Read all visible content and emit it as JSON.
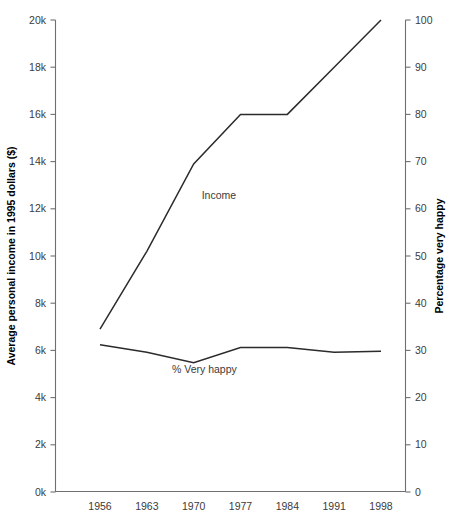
{
  "chart_data": {
    "type": "line",
    "title": "",
    "xlabel": "",
    "ylabel": "Average personal income in 1995 dollars ($)",
    "y2label": "Percentage very happy",
    "categories": [
      "1956",
      "1963",
      "1970",
      "1977",
      "1984",
      "1991",
      "1998"
    ],
    "x": [
      1956,
      1963,
      1970,
      1977,
      1984,
      1991,
      1998
    ],
    "ylim": [
      0,
      20000
    ],
    "y2lim": [
      0,
      100
    ],
    "grid": false,
    "legend_position": "inline-annotation",
    "yticks": [
      "0k",
      "2k",
      "4k",
      "6k",
      "8k",
      "10k",
      "12k",
      "14k",
      "16k",
      "18k",
      "20k"
    ],
    "ytick_values": [
      0,
      2000,
      4000,
      6000,
      8000,
      10000,
      12000,
      14000,
      16000,
      18000,
      20000
    ],
    "y2ticks": [
      "0",
      "10",
      "20",
      "30",
      "40",
      "50",
      "60",
      "70",
      "80",
      "90",
      "100"
    ],
    "y2tick_values": [
      0,
      10,
      20,
      30,
      40,
      50,
      60,
      70,
      80,
      90,
      100
    ],
    "series": [
      {
        "name": "Income",
        "axis": "left",
        "label": "Income",
        "label_x": 1971.2,
        "label_y": 12400,
        "values": [
          6900,
          10200,
          13900,
          16000,
          16000,
          18000,
          20000
        ]
      },
      {
        "name": "% Very happy",
        "axis": "right",
        "label": "% Very happy",
        "label_x": 1971.6,
        "label_y": 25.2,
        "values": [
          31.2,
          29.6,
          27.4,
          30.6,
          30.6,
          29.6,
          29.8
        ]
      }
    ]
  }
}
